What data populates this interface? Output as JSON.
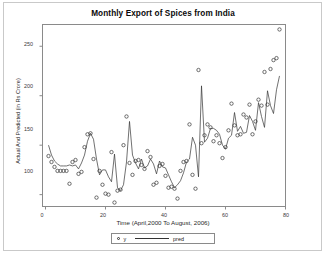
{
  "chart_data": {
    "type": "scatter",
    "title": "Monthly Export of Spices from India",
    "xlabel": "Time (April,2000 To August, 2006)",
    "ylabel": "Actual And Predicted (in Rs Crore)",
    "xlim": [
      -1,
      80
    ],
    "ylim": [
      88,
      272
    ],
    "xticks": [
      0,
      20,
      40,
      60,
      80
    ],
    "yticks": [
      100,
      150,
      200,
      250
    ],
    "grid": false,
    "legend_position": "bottom-center",
    "legend": [
      {
        "name": "y",
        "marker": "circle",
        "style": "points"
      },
      {
        "name": "pred",
        "marker": "line",
        "style": "line"
      }
    ],
    "x": [
      1,
      2,
      3,
      4,
      5,
      6,
      7,
      8,
      9,
      10,
      11,
      12,
      13,
      14,
      15,
      16,
      17,
      18,
      19,
      20,
      21,
      22,
      23,
      24,
      25,
      26,
      27,
      28,
      29,
      30,
      31,
      32,
      33,
      34,
      35,
      36,
      37,
      38,
      39,
      40,
      41,
      42,
      43,
      44,
      45,
      46,
      47,
      48,
      49,
      50,
      51,
      52,
      53,
      54,
      55,
      56,
      57,
      58,
      59,
      60,
      61,
      62,
      63,
      64,
      65,
      66,
      67,
      68,
      69,
      70,
      71,
      72,
      73,
      74,
      75,
      76,
      77,
      78
    ],
    "series": [
      {
        "name": "y",
        "marker": "circle",
        "values": [
          139,
          133,
          128,
          124,
          124,
          124,
          124,
          111,
          133,
          135,
          121,
          123,
          148,
          161,
          162,
          136,
          97,
          124,
          110,
          101,
          100,
          143,
          92,
          104,
          105,
          150,
          179,
          132,
          120,
          134,
          135,
          130,
          126,
          144,
          138,
          110,
          112,
          129,
          131,
          119,
          107,
          108,
          106,
          96,
          124,
          133,
          134,
          171,
          120,
          106,
          226,
          152,
          160,
          171,
          168,
          154,
          160,
          152,
          137,
          148,
          165,
          192,
          170,
          160,
          161,
          181,
          178,
          191,
          161,
          174,
          196,
          190,
          224,
          191,
          227,
          236,
          238,
          267
        ]
      },
      {
        "name": "pred",
        "marker": "line",
        "values": [
          150,
          140,
          134,
          131,
          129,
          129,
          129,
          130,
          129,
          130,
          126,
          132,
          140,
          154,
          162,
          156,
          136,
          120,
          125,
          125,
          118,
          113,
          141,
          107,
          104,
          110,
          133,
          174,
          140,
          132,
          126,
          136,
          127,
          129,
          136,
          131,
          121,
          134,
          128,
          127,
          120,
          113,
          107,
          110,
          114,
          122,
          133,
          136,
          158,
          150,
          118,
          210,
          153,
          157,
          167,
          167,
          165,
          161,
          150,
          146,
          157,
          160,
          183,
          164,
          169,
          162,
          163,
          180,
          174,
          165,
          193,
          179,
          168,
          205,
          190,
          182,
          206,
          220
        ]
      }
    ]
  },
  "axes": {
    "ytick_labels": [
      "250",
      "200",
      "150",
      "100"
    ],
    "xtick_labels": [
      "0",
      "20",
      "40",
      "60",
      "80"
    ]
  },
  "legend": {
    "series_label": "y",
    "pred_label": "pred"
  },
  "colors": {
    "line": "#333333",
    "marker": "#333333",
    "axis": "#8a8a8a",
    "text": "#1a1a1a",
    "background": "#ffffff"
  }
}
